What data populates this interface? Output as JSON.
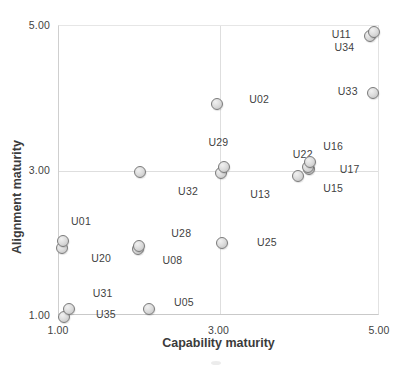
{
  "figure": {
    "background": "#ffffff"
  },
  "chart_data": {
    "type": "scatter",
    "title": "",
    "xlabel": "Capability maturity",
    "ylabel": "Alignment maturity",
    "xlim": [
      1.0,
      5.0
    ],
    "ylim": [
      1.0,
      5.0
    ],
    "xticks": [
      {
        "value": 1.0,
        "label": "1.00"
      },
      {
        "value": 3.0,
        "label": "3.00"
      },
      {
        "value": 5.0,
        "label": "5.00"
      }
    ],
    "yticks": [
      {
        "value": 1.0,
        "label": "1.00"
      },
      {
        "value": 3.0,
        "label": "3.00"
      },
      {
        "value": 5.0,
        "label": "5.00"
      }
    ],
    "grid": {
      "x_values": [
        3.0
      ],
      "y_values": [
        3.0
      ],
      "color": "#dedede"
    },
    "marker_style": {
      "fill": "#d9d9d9",
      "stroke": "#7a7a7a",
      "diameter_px": 13
    },
    "points": [
      {
        "label": "U20",
        "x": 1.04,
        "y": 1.94,
        "label_dx": 39,
        "label_dy": 10
      },
      {
        "label": "U01",
        "x": 1.05,
        "y": 2.04,
        "label_dx": 18,
        "label_dy": -20
      },
      {
        "label": "U35",
        "x": 1.06,
        "y": 0.99,
        "label_dx": 42,
        "label_dy": -3
      },
      {
        "label": "U31",
        "x": 1.12,
        "y": 1.1,
        "label_dx": 34,
        "label_dy": -16
      },
      {
        "label": "U05",
        "x": 2.12,
        "y": 1.1,
        "label_dx": 35,
        "label_dy": -7
      },
      {
        "label": "U08",
        "x": 1.99,
        "y": 1.93,
        "label_dx": 34,
        "label_dy": 11
      },
      {
        "label": "U28",
        "x": 2.0,
        "y": 1.97,
        "label_dx": 42,
        "label_dy": -13
      },
      {
        "label": "U32",
        "x": 2.01,
        "y": 2.99,
        "label_dx": 48,
        "label_dy": 19
      },
      {
        "label": "U02",
        "x": 2.97,
        "y": 3.93,
        "label_dx": 42,
        "label_dy": -5
      },
      {
        "label": "U13",
        "x": 3.02,
        "y": 2.97,
        "label_dx": 39,
        "label_dy": 21
      },
      {
        "label": "U29",
        "x": 3.06,
        "y": 3.05,
        "label_dx": -6,
        "label_dy": -25
      },
      {
        "label": "U25",
        "x": 3.03,
        "y": 2.01,
        "label_dx": 45,
        "label_dy": -1
      },
      {
        "label": "U17",
        "x": 4.11,
        "y": 3.03,
        "label_dx": 41,
        "label_dy": 0
      },
      {
        "label": "U15",
        "x": 3.98,
        "y": 2.93,
        "label_dx": 35,
        "label_dy": 12
      },
      {
        "label": "U22",
        "x": 4.1,
        "y": 3.06,
        "label_dx": -5,
        "label_dy": -13
      },
      {
        "label": "U16",
        "x": 4.13,
        "y": 3.12,
        "label_dx": 23,
        "label_dy": -16
      },
      {
        "label": "U34",
        "x": 4.88,
        "y": 4.86,
        "label_dx": -26,
        "label_dy": 11
      },
      {
        "label": "U11",
        "x": 4.93,
        "y": 4.92,
        "label_dx": -33,
        "label_dy": 2
      },
      {
        "label": "U33",
        "x": 4.91,
        "y": 4.08,
        "label_dx": -25,
        "label_dy": -2
      }
    ]
  }
}
